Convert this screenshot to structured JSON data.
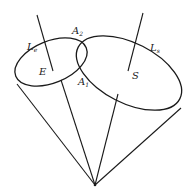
{
  "diagram": {
    "type": "cone-intersection",
    "labels": {
      "le": {
        "main": "L",
        "sub": "e"
      },
      "ls": {
        "main": "L",
        "sub": "s"
      },
      "a2": {
        "main": "A",
        "sub": "2"
      },
      "a1": {
        "main": "A",
        "sub": "1"
      },
      "e": "E",
      "s": "S"
    },
    "colors": {
      "stroke": "#1a1a1a",
      "background": "#ffffff"
    }
  }
}
